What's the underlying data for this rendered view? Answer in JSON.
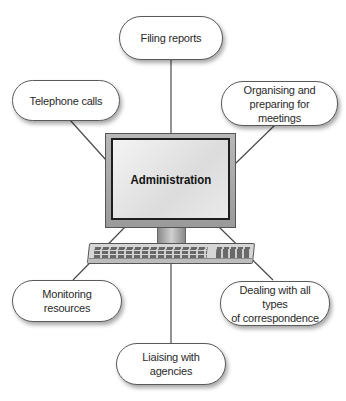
{
  "diagram": {
    "center": {
      "label": "Administration"
    },
    "nodes": [
      {
        "id": "filing",
        "label": "Filing reports"
      },
      {
        "id": "telephone",
        "label": "Telephone calls"
      },
      {
        "id": "meetings",
        "label": "Organising and preparing for meetings",
        "line1": "Organising and",
        "line2": "preparing for meetings"
      },
      {
        "id": "monitoring",
        "label": "Monitoring resources"
      },
      {
        "id": "correspondence",
        "label": "Dealing with all types of correspondence",
        "line1": "Dealing with all types",
        "line2": "of correspondence"
      },
      {
        "id": "liaising",
        "label": "Liaising with agencies"
      }
    ],
    "colors": {
      "line": "#4a4a4a",
      "border": "#5a5a5a",
      "text": "#2a2a2a"
    }
  }
}
